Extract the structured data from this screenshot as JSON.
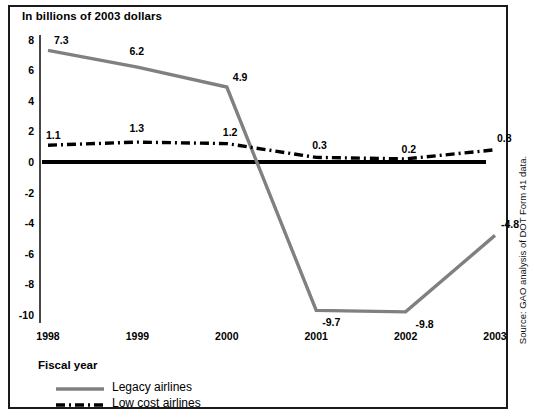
{
  "chart_data": {
    "type": "line",
    "title": "In billions of 2003 dollars",
    "xlabel": "Fiscal year",
    "ylabel": "",
    "categories": [
      "1998",
      "1999",
      "2000",
      "2001",
      "2002",
      "2003"
    ],
    "x": [
      1998,
      1999,
      2000,
      2001,
      2002,
      2003
    ],
    "series": [
      {
        "name": "Legacy airlines",
        "values": [
          7.3,
          6.2,
          4.9,
          -9.7,
          -9.8,
          -4.8
        ],
        "color": "#808080",
        "style": "solid"
      },
      {
        "name": "Low cost airlines",
        "values": [
          1.1,
          1.3,
          1.2,
          0.3,
          0.2,
          0.8
        ],
        "color": "#000000",
        "style": "dash-dot"
      }
    ],
    "ylim": [
      -11,
      8.8
    ],
    "yticks": [
      8,
      6,
      4,
      2,
      0,
      -2,
      -4,
      -6,
      -8,
      -10
    ],
    "ytick_labels": [
      "8",
      "6",
      "4",
      "2",
      "0",
      "-2",
      "-4",
      "-6",
      "-8",
      "-10"
    ],
    "grid": false,
    "legend_position": "bottom-left",
    "zero_line": true,
    "data_labels": {
      "Legacy airlines": [
        "7.3",
        "6.2",
        "4.9",
        "-9.7",
        "-9.8",
        "-4.8"
      ],
      "Low cost airlines": [
        "1.1",
        "1.3",
        "1.2",
        "0.3",
        "0.2",
        "0.8"
      ]
    }
  },
  "legend": {
    "title": "Fiscal year",
    "entries": [
      {
        "label": "Legacy airlines",
        "swatch": "solid-gray-line"
      },
      {
        "label": "Low cost airlines",
        "swatch": "dash-dot-black-line"
      }
    ]
  },
  "source": {
    "text": "Source: GAO analysis of DOT Form 41 data."
  }
}
